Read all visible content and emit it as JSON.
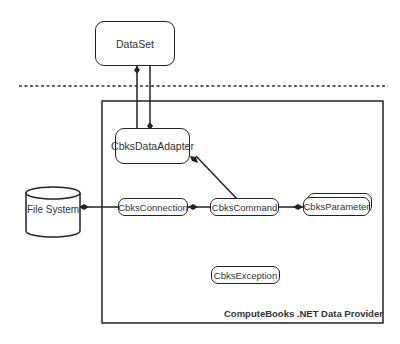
{
  "diagram": {
    "nodes": {
      "dataset": {
        "label": "DataSet"
      },
      "data_adapter": {
        "label": "CbksDataAdapter"
      },
      "connection": {
        "label": "CbksConnection"
      },
      "command": {
        "label": "CbksCommand"
      },
      "parameter": {
        "label": "CbksParameter"
      },
      "exception": {
        "label": "CbksException"
      },
      "file_system": {
        "label": "File System"
      }
    },
    "container": {
      "label": "ComputeBooks .NET Data Provider"
    },
    "edges": [
      {
        "from": "DataSet",
        "to": "CbksDataAdapter",
        "type": "composition",
        "diamond_at": "DataSet"
      },
      {
        "from": "CbksDataAdapter",
        "to": "DataSet",
        "type": "composition",
        "diamond_at": "CbksDataAdapter"
      },
      {
        "from": "CbksCommand",
        "to": "CbksDataAdapter",
        "type": "composition",
        "diamond_at": "CbksDataAdapter"
      },
      {
        "from": "CbksCommand",
        "to": "CbksConnection",
        "type": "composition",
        "diamond_at": "CbksConnection"
      },
      {
        "from": "CbksParameter",
        "to": "CbksCommand",
        "type": "composition",
        "diamond_at": "CbksParameter"
      },
      {
        "from": "CbksConnection",
        "to": "File System",
        "type": "composition",
        "diamond_at": "File System"
      }
    ],
    "separator": {
      "style": "dashed"
    },
    "colors": {
      "stroke": "#222222",
      "text": "#333333",
      "background": "#ffffff"
    }
  }
}
